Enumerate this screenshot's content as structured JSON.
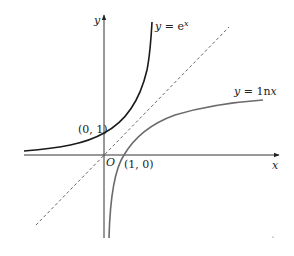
{
  "diagram": {
    "title": "",
    "axes": {
      "x_label": "x",
      "y_label": "y",
      "origin_label": "O"
    },
    "curves": [
      {
        "name": "exp",
        "label": "y = e",
        "superscript": "x",
        "color": "#1a1a1a"
      },
      {
        "name": "ln",
        "label": "y = 1n",
        "label_var": "x",
        "color": "#6b6b6b"
      },
      {
        "name": "identity",
        "label": "y = x",
        "style": "dashed",
        "color": "#555555"
      }
    ],
    "points": [
      {
        "label": "(0, 1)"
      },
      {
        "label": "(1, 0)"
      }
    ]
  }
}
